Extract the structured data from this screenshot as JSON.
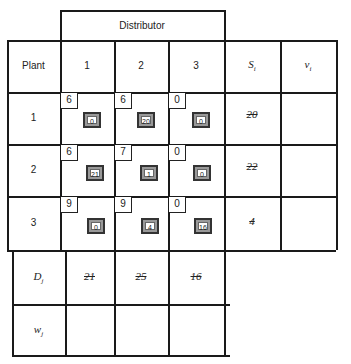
{
  "header": {
    "distributor": "Distributor",
    "plant": "Plant",
    "cols": [
      "1",
      "2",
      "3"
    ],
    "supply": "S_i",
    "v": "v_i"
  },
  "rows": [
    {
      "label": "1",
      "costs": [
        "6",
        "6",
        "0"
      ],
      "alloc": [
        "0",
        "20",
        "0"
      ],
      "supply": "20"
    },
    {
      "label": "2",
      "costs": [
        "6",
        "7",
        "0"
      ],
      "alloc": [
        "21",
        "1",
        "0"
      ],
      "supply": "22"
    },
    {
      "label": "3",
      "costs": [
        "9",
        "9",
        "0"
      ],
      "alloc": [
        "0",
        "4",
        "16"
      ],
      "supply": "4"
    }
  ],
  "demand": {
    "label": "D_j",
    "values": [
      "21",
      "25",
      "16"
    ]
  },
  "w": {
    "label": "w_j"
  }
}
